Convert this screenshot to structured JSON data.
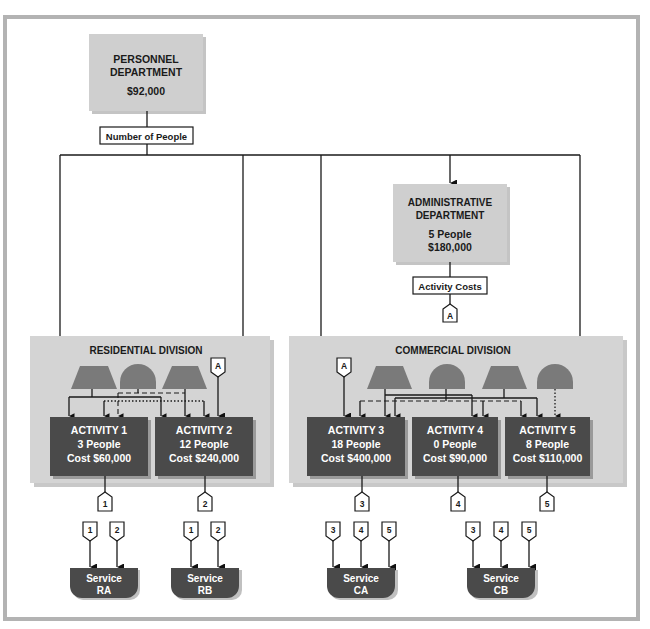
{
  "colors": {
    "frame": "#b3b3b3",
    "dept_box": "#cfcfcf",
    "division_panel": "#d4d4d4",
    "activity_box": "#4a4a4a",
    "resource_shape": "#7a7a7a",
    "service_box": "#4a4a4a",
    "line": "#1a1a1a"
  },
  "personnel": {
    "line1": "PERSONNEL",
    "line2": "DEPARTMENT",
    "cost": "$92,000",
    "driver_label": "Number of People"
  },
  "administrative": {
    "line1": "ADMINISTRATIVE",
    "line2": "DEPARTMENT",
    "people": "5 People",
    "cost": "$180,000",
    "driver_label": "Activity Costs",
    "connector": "A"
  },
  "divisions": [
    {
      "title": "RESIDENTIAL DIVISION",
      "connector": "A",
      "activities": [
        {
          "name": "ACTIVITY 1",
          "people": "3 People",
          "cost": "Cost $60,000",
          "output_tag": "1"
        },
        {
          "name": "ACTIVITY 2",
          "people": "12 People",
          "cost": "Cost $240,000",
          "output_tag": "2"
        }
      ]
    },
    {
      "title": "COMMERCIAL DIVISION",
      "connector": "A",
      "activities": [
        {
          "name": "ACTIVITY 3",
          "people": "18 People",
          "cost": "Cost $400,000",
          "output_tag": "3"
        },
        {
          "name": "ACTIVITY 4",
          "people": "0 People",
          "cost": "Cost $90,000",
          "output_tag": "4"
        },
        {
          "name": "ACTIVITY 5",
          "people": "8 People",
          "cost": "Cost $110,000",
          "output_tag": "5"
        }
      ]
    }
  ],
  "services": [
    {
      "line1": "Service",
      "line2": "RA",
      "inputs": [
        "1",
        "2"
      ]
    },
    {
      "line1": "Service",
      "line2": "RB",
      "inputs": [
        "1",
        "2"
      ]
    },
    {
      "line1": "Service",
      "line2": "CA",
      "inputs": [
        "3",
        "4",
        "5"
      ]
    },
    {
      "line1": "Service",
      "line2": "CB",
      "inputs": [
        "3",
        "4",
        "5"
      ]
    }
  ]
}
